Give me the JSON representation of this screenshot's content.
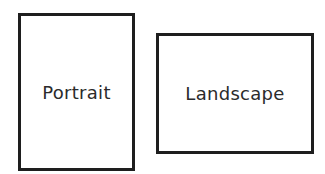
{
  "orientations": [
    {
      "label": "Portrait"
    },
    {
      "label": "Landscape"
    }
  ]
}
